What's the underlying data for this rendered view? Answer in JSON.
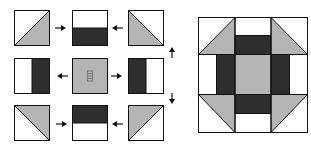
{
  "diagram": {
    "colors": {
      "light": "#ffffff",
      "medium": "#b4b4b4",
      "dark": "#2e2e2e",
      "outline": "#111111"
    },
    "pieces": [
      {
        "id": "top-left",
        "type": "half-square-triangle",
        "orientation": "gray-bottom-right"
      },
      {
        "id": "top-center",
        "type": "two-patch",
        "orientation": "dark-bottom"
      },
      {
        "id": "top-right",
        "type": "half-square-triangle",
        "orientation": "gray-bottom-left"
      },
      {
        "id": "middle-left",
        "type": "two-patch",
        "orientation": "dark-right"
      },
      {
        "id": "center",
        "type": "center-square",
        "label": "CEN"
      },
      {
        "id": "middle-right",
        "type": "two-patch",
        "orientation": "dark-left"
      },
      {
        "id": "bottom-left",
        "type": "half-square-triangle",
        "orientation": "gray-top-right"
      },
      {
        "id": "bottom-center",
        "type": "two-patch",
        "orientation": "dark-top"
      },
      {
        "id": "bottom-right",
        "type": "half-square-triangle",
        "orientation": "gray-top-left"
      }
    ],
    "arrows": [
      {
        "id": "arrow-top-left",
        "direction": "right"
      },
      {
        "id": "arrow-top-right",
        "direction": "left"
      },
      {
        "id": "arrow-mid-left",
        "direction": "left"
      },
      {
        "id": "arrow-mid-right",
        "direction": "right"
      },
      {
        "id": "arrow-bot-left",
        "direction": "right"
      },
      {
        "id": "arrow-bot-right",
        "direction": "left"
      },
      {
        "id": "arrow-up",
        "direction": "up"
      },
      {
        "id": "arrow-down",
        "direction": "down"
      }
    ],
    "center_label": "CEN",
    "finished_block": "assembled-shoo-fly-block"
  }
}
